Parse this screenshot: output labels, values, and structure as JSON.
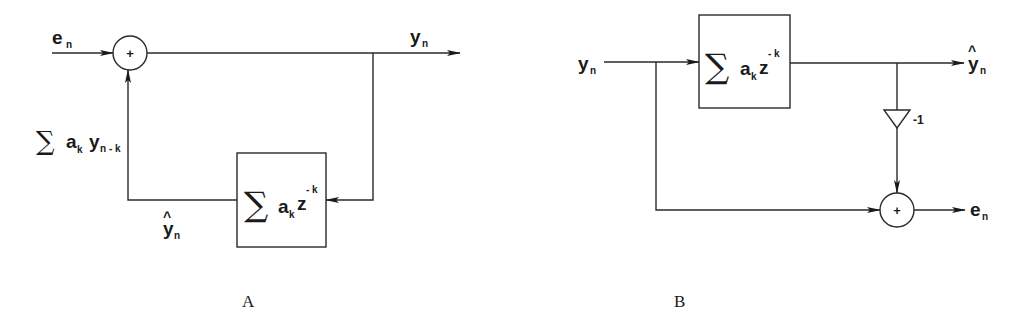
{
  "figure": {
    "panels": [
      {
        "caption": "A",
        "input_label": "e",
        "input_sub": "n",
        "output_label": "y",
        "output_sub": "n",
        "adder_symbol": "+",
        "feedback_sum_label": "∑a",
        "feedback_sum_k": "k",
        "feedback_sum_y": "y",
        "feedback_sum_y_sub": "n - k",
        "prediction_label": "y",
        "prediction_hat": "^",
        "prediction_sub": "n",
        "block": {
          "sigma": "∑",
          "a": "a",
          "a_sub": "k",
          "z": "z",
          "z_sup": "- k"
        }
      },
      {
        "caption": "B",
        "input_label": "y",
        "input_sub": "n",
        "output_label": "y",
        "output_hat": "^",
        "output_sub": "n",
        "gain_label": "-1",
        "adder_symbol": "+",
        "error_label": "e",
        "error_sub": "n",
        "block": {
          "sigma": "∑",
          "a": "a",
          "a_sub": "k",
          "z": "z",
          "z_sup": "- k"
        }
      }
    ]
  }
}
